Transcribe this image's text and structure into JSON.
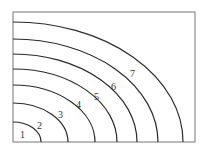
{
  "diagram": {
    "type": "quarter-ellipse contour curves in a box",
    "box": {
      "x1": 13,
      "y1": 12,
      "x2": 195,
      "y2": 142
    },
    "curves": [
      {
        "label": "1",
        "rx": 28,
        "ry": 20,
        "label_x": 20,
        "label_y": 138
      },
      {
        "label": "2",
        "rx": 55,
        "ry": 39,
        "label_x": 37,
        "label_y": 129
      },
      {
        "label": "3",
        "rx": 82,
        "ry": 57,
        "label_x": 58,
        "label_y": 118
      },
      {
        "label": "4",
        "rx": 104,
        "ry": 73,
        "label_x": 76,
        "label_y": 108
      },
      {
        "label": "5",
        "rx": 124,
        "ry": 88,
        "label_x": 94,
        "label_y": 100
      },
      {
        "label": "6",
        "rx": 145,
        "ry": 103,
        "label_x": 111,
        "label_y": 90
      },
      {
        "label": "7",
        "rx": 170,
        "ry": 120,
        "label_x": 130,
        "label_y": 77
      }
    ],
    "stroke_color": "#2a2a2a",
    "box_color": "#777777"
  }
}
